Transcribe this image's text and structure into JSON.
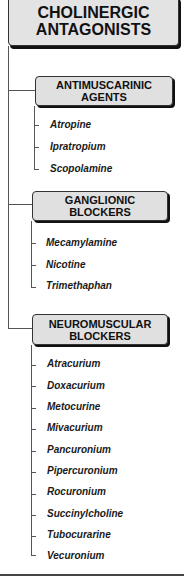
{
  "root": {
    "title": "CHOLINERGIC\nANTAGONISTS"
  },
  "categories": [
    {
      "title": "ANTIMUSCARINIC\nAGENTS",
      "drugs": [
        "Atropine",
        "Ipratropium",
        "Scopolamine"
      ]
    },
    {
      "title": "GANGLIONIC\nBLOCKERS",
      "drugs": [
        "Mecamylamine",
        "Nicotine",
        "Trimethaphan"
      ]
    },
    {
      "title": "NEUROMUSCULAR\nBLOCKERS",
      "drugs": [
        "Atracurium",
        "Doxacurium",
        "Metocurine",
        "Mivacurium",
        "Pancuronium",
        "Pipercuronium",
        "Rocuronium",
        "Succinylcholine",
        "Tubocurarine",
        "Vecuronium"
      ]
    }
  ],
  "colors": {
    "box_fill": "#e0e0e0",
    "box_shadow": "#111111",
    "line": "#555555",
    "text": "#111111"
  }
}
